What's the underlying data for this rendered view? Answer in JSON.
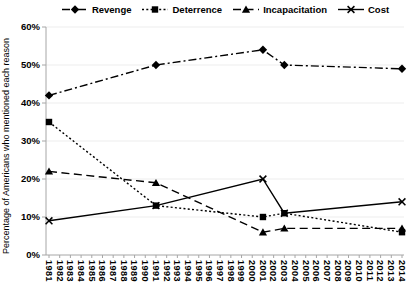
{
  "figure": {
    "background": "#ffffff",
    "axis_color": "#a6a6a6",
    "gridline_color": "#ededed",
    "text_color": "#000000",
    "series_color": "#000000"
  },
  "chart_data": {
    "type": "line",
    "title": "",
    "xlabel": "",
    "ylabel": "Percentage of Americans who mentioned each reason",
    "ylim": [
      0,
      60
    ],
    "ytick_step": 10,
    "ytick_labels": [
      "0%",
      "10%",
      "20%",
      "30%",
      "40%",
      "50%",
      "60%"
    ],
    "x_tick_labels": [
      "1981",
      "1982",
      "1983",
      "1984",
      "1985",
      "1986",
      "1987",
      "1988",
      "1989",
      "1990",
      "1991",
      "1992",
      "1993",
      "1994",
      "1995",
      "1996",
      "1997",
      "1998",
      "1999",
      "2000",
      "2001",
      "2002",
      "2003",
      "2004",
      "2005",
      "2006",
      "2007",
      "2008",
      "2009",
      "2010",
      "2011",
      "2012",
      "2013",
      "2014"
    ],
    "grid": "faint horizontal gridlines",
    "legend_position": "top",
    "series": [
      {
        "name": "Revenge",
        "marker": "diamond",
        "line_style": "dash-dot",
        "color": "#000000",
        "x": [
          1981,
          1991,
          2001,
          2003,
          2014
        ],
        "values": [
          42,
          50,
          54,
          50,
          49
        ]
      },
      {
        "name": "Deterrence",
        "marker": "square",
        "line_style": "dotted",
        "color": "#000000",
        "x": [
          1981,
          1991,
          2001,
          2003,
          2014
        ],
        "values": [
          35,
          13,
          10,
          11,
          6
        ]
      },
      {
        "name": "Incapacitation",
        "marker": "triangle",
        "line_style": "dashed",
        "color": "#000000",
        "x": [
          1981,
          1991,
          2001,
          2003,
          2014
        ],
        "values": [
          22,
          19,
          6,
          7,
          7
        ]
      },
      {
        "name": "Cost",
        "marker": "x",
        "line_style": "solid",
        "color": "#000000",
        "x": [
          1981,
          1991,
          2001,
          2003,
          2014
        ],
        "values": [
          9,
          13,
          20,
          11,
          14
        ]
      }
    ]
  }
}
